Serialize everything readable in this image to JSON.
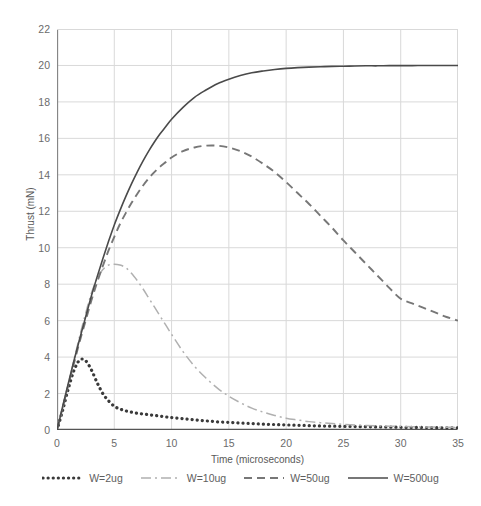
{
  "chart_data": {
    "type": "line",
    "title": "",
    "xlabel": "Time (microseconds)",
    "ylabel": "Thrust (mN)",
    "xlim": [
      0,
      35
    ],
    "ylim": [
      0,
      22
    ],
    "xticks": [
      0,
      5,
      10,
      15,
      20,
      25,
      30,
      35
    ],
    "yticks": [
      0,
      2,
      4,
      6,
      8,
      10,
      12,
      14,
      16,
      18,
      20,
      22
    ],
    "grid": true,
    "legend_position": "bottom",
    "x": [
      0,
      0.5,
      1,
      1.5,
      2,
      2.5,
      3,
      3.5,
      4,
      4.5,
      5,
      5.5,
      6,
      6.5,
      7,
      7.5,
      8,
      8.5,
      9,
      9.5,
      10,
      11,
      12,
      13,
      14,
      15,
      16,
      17,
      18,
      19,
      20,
      21,
      22,
      23,
      24,
      25,
      26,
      27,
      28,
      29,
      30,
      31,
      32,
      33,
      34,
      35
    ],
    "series": [
      {
        "name": "W=2ug",
        "style": "dotted",
        "color": "#3a3a3a",
        "values": [
          0,
          1.1,
          2.3,
          3.3,
          3.85,
          3.8,
          3.3,
          2.6,
          2.0,
          1.6,
          1.3,
          1.15,
          1.05,
          0.98,
          0.92,
          0.88,
          0.84,
          0.8,
          0.76,
          0.72,
          0.68,
          0.62,
          0.56,
          0.5,
          0.45,
          0.42,
          0.38,
          0.35,
          0.32,
          0.3,
          0.28,
          0.26,
          0.24,
          0.22,
          0.21,
          0.2,
          0.19,
          0.18,
          0.17,
          0.16,
          0.15,
          0.14,
          0.14,
          0.13,
          0.12,
          0.12
        ]
      },
      {
        "name": "W=10ug",
        "style": "dashdot",
        "color": "#b0b0b0",
        "values": [
          0,
          1.2,
          2.5,
          3.9,
          5.2,
          6.4,
          7.5,
          8.3,
          8.8,
          9.05,
          9.1,
          9.05,
          8.9,
          8.6,
          8.2,
          7.75,
          7.25,
          6.75,
          6.25,
          5.75,
          5.25,
          4.3,
          3.5,
          2.85,
          2.3,
          1.85,
          1.5,
          1.2,
          0.98,
          0.8,
          0.65,
          0.55,
          0.46,
          0.4,
          0.35,
          0.31,
          0.28,
          0.25,
          0.23,
          0.21,
          0.2,
          0.18,
          0.17,
          0.16,
          0.15,
          0.14
        ]
      },
      {
        "name": "W=50ug",
        "style": "dashed",
        "color": "#777777",
        "values": [
          0,
          1.25,
          2.5,
          3.7,
          4.9,
          6.0,
          7.1,
          8.1,
          9.0,
          9.85,
          10.6,
          11.3,
          11.9,
          12.45,
          12.95,
          13.4,
          13.8,
          14.15,
          14.45,
          14.7,
          14.95,
          15.3,
          15.5,
          15.6,
          15.6,
          15.5,
          15.3,
          15.0,
          14.6,
          14.15,
          13.6,
          13.0,
          12.4,
          11.75,
          11.1,
          10.4,
          9.75,
          9.1,
          8.45,
          7.8,
          7.2,
          6.95,
          6.7,
          6.45,
          6.2,
          6.0
        ]
      },
      {
        "name": "W=500ug",
        "style": "solid",
        "color": "#4a4a4a",
        "values": [
          0,
          1.3,
          2.6,
          3.85,
          5.05,
          6.2,
          7.35,
          8.4,
          9.4,
          10.35,
          11.25,
          12.05,
          12.8,
          13.5,
          14.15,
          14.75,
          15.3,
          15.8,
          16.25,
          16.65,
          17.05,
          17.7,
          18.25,
          18.65,
          19.0,
          19.25,
          19.45,
          19.6,
          19.7,
          19.78,
          19.84,
          19.88,
          19.91,
          19.93,
          19.95,
          19.96,
          19.97,
          19.98,
          19.98,
          19.99,
          19.99,
          19.99,
          20.0,
          20.0,
          20.0,
          20.0
        ]
      }
    ]
  },
  "axes": {
    "y_title": "Thrust (mN)",
    "x_title": "Time (microseconds)",
    "y_tick_labels": [
      "0",
      "2",
      "4",
      "6",
      "8",
      "10",
      "12",
      "14",
      "16",
      "18",
      "20",
      "22"
    ],
    "x_tick_labels": [
      "0",
      "5",
      "10",
      "15",
      "20",
      "25",
      "30",
      "35"
    ]
  },
  "legend": {
    "items": [
      {
        "label": "W=2ug",
        "style": "dotted",
        "color": "#3a3a3a"
      },
      {
        "label": "W=10ug",
        "style": "dashdot",
        "color": "#b0b0b0"
      },
      {
        "label": "W=50ug",
        "style": "dashed",
        "color": "#777777"
      },
      {
        "label": "W=500ug",
        "style": "solid",
        "color": "#4a4a4a"
      }
    ]
  },
  "colors": {
    "background": "#ffffff",
    "grid": "#d9d9d9",
    "axis": "#868686",
    "tick_text": "#6b6b6b",
    "title_text": "#595959"
  }
}
